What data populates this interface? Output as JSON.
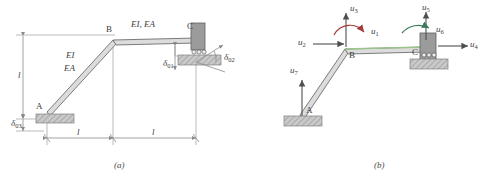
{
  "figure": {
    "type": "structural-frame-diagram",
    "panels": [
      {
        "id": "a",
        "caption": "(a)",
        "description": "Two-bar plane frame with inclined member A-B and horizontal member B-C, showing section properties and prescribed support displacements",
        "nodes": [
          {
            "label": "A",
            "x": 47,
            "y": 113,
            "support": "fixed-hatched-base"
          },
          {
            "label": "B",
            "x": 113,
            "y": 41,
            "support": "none"
          },
          {
            "label": "C",
            "x": 196,
            "y": 38,
            "support": "roller-on-inclined-base"
          }
        ],
        "member_labels": [
          {
            "text": "EI",
            "x": 66,
            "y": 57
          },
          {
            "text": "EA",
            "x": 64,
            "y": 70
          },
          {
            "text": "EI, EA",
            "x": 132,
            "y": 26
          }
        ],
        "dimensions": [
          {
            "name": "vertical-height",
            "label": "l",
            "orientation": "vertical"
          },
          {
            "name": "span-left",
            "label": "l",
            "orientation": "horizontal"
          },
          {
            "name": "span-right",
            "label": "l",
            "orientation": "horizontal"
          }
        ],
        "prescribed_displacements": [
          {
            "symbol": "δ",
            "subscript": "01",
            "name": "delta-0-1",
            "at": "C",
            "sense": "vertical"
          },
          {
            "symbol": "δ",
            "subscript": "02",
            "name": "delta-0-2",
            "at": "C",
            "sense": "inclined"
          },
          {
            "symbol": "δ",
            "subscript": "03",
            "name": "delta-0-3",
            "at": "A",
            "sense": "vertical"
          }
        ]
      },
      {
        "id": "b",
        "caption": "(b)",
        "description": "Same frame showing the seven global degrees of freedom",
        "nodes": [
          {
            "label": "A",
            "x": 54,
            "y": 116,
            "support": "hatched-base"
          },
          {
            "label": "B",
            "x": 99,
            "y": 50,
            "support": "none"
          },
          {
            "label": "C",
            "x": 178,
            "y": 48,
            "support": "roller-on-base"
          }
        ],
        "dofs": [
          {
            "id": "u1",
            "symbol": "u",
            "subscript": "1",
            "name": "dof-u1",
            "kind": "rotation",
            "at": "B",
            "color": "#a33a3a"
          },
          {
            "id": "u2",
            "symbol": "u",
            "subscript": "2",
            "name": "dof-u2",
            "kind": "translation-horizontal",
            "at": "B",
            "color": "#555555"
          },
          {
            "id": "u3",
            "symbol": "u",
            "subscript": "3",
            "name": "dof-u3",
            "kind": "translation-vertical",
            "at": "B",
            "color": "#555555"
          },
          {
            "id": "u4",
            "symbol": "u",
            "subscript": "4",
            "name": "dof-u4",
            "kind": "translation-horizontal",
            "at": "C",
            "color": "#555555"
          },
          {
            "id": "u5",
            "symbol": "u",
            "subscript": "5",
            "name": "dof-u5",
            "kind": "translation-vertical",
            "at": "C",
            "color": "#555555"
          },
          {
            "id": "u6",
            "symbol": "u",
            "subscript": "6",
            "name": "dof-u6",
            "kind": "rotation",
            "at": "C",
            "color": "#3a7a5a"
          },
          {
            "id": "u7",
            "symbol": "u",
            "subscript": "7",
            "name": "dof-u7",
            "kind": "translation-vertical",
            "at": "A",
            "color": "#555555"
          }
        ]
      }
    ]
  },
  "colors": {
    "line": "#6e6e6e",
    "member_fill": "#d8d8d8",
    "hatch": "#9a9a9a",
    "support_block": "#9b9b9b",
    "dim": "#8a8a8a",
    "rotation_b": "#a33a3a",
    "rotation_c": "#3a7a5a",
    "highlight": "#b9d4a8"
  }
}
